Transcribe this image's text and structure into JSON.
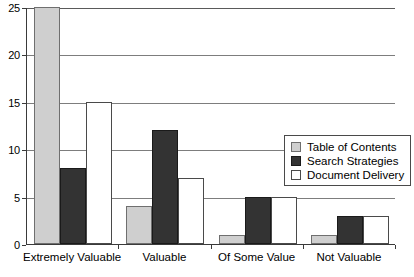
{
  "chart_data": {
    "type": "bar",
    "title": "",
    "subtitle": "",
    "xlabel": "",
    "ylabel": "",
    "categories": [
      "Extremely Valuable",
      "Valuable",
      "Of Some Value",
      "Not Valuable"
    ],
    "series": [
      {
        "name": "Table of Contents",
        "values": [
          25,
          4,
          1,
          1
        ],
        "color": "#cfcfcf"
      },
      {
        "name": "Search Strategies",
        "values": [
          8,
          12,
          5,
          3
        ],
        "color": "#333333"
      },
      {
        "name": "Document Delivery",
        "values": [
          15,
          7,
          5,
          3
        ],
        "color": "#ffffff"
      }
    ],
    "ylim": [
      0,
      25
    ],
    "yticks": [
      0,
      5,
      10,
      15,
      20,
      25
    ],
    "ytick_labels": [
      "0",
      "5",
      "10",
      "15",
      "20",
      "25"
    ],
    "grid": true,
    "grid_axis": "y",
    "legend_position": "center-right",
    "bar_style": "grouped"
  },
  "axis": {
    "y_tick_labels": [
      "25",
      "20",
      "15",
      "10",
      "5",
      "0"
    ],
    "x_tick_labels": [
      "Extremely Valuable",
      "Valuable",
      "Of Some Value",
      "Not Valuable"
    ]
  },
  "legend": {
    "entries": [
      {
        "label": "Table of Contents"
      },
      {
        "label": "Search Strategies"
      },
      {
        "label": "Document Delivery"
      }
    ]
  }
}
